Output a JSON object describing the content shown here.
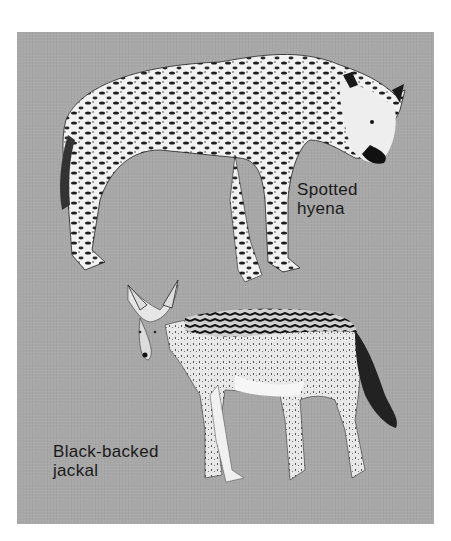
{
  "illustration": {
    "background_color": "#a8a8a8",
    "animals": [
      {
        "name": "hyena",
        "label_lines": [
          "Spotted",
          "hyena"
        ]
      },
      {
        "name": "jackal",
        "label_lines": [
          "Black-backed",
          "jackal"
        ]
      }
    ]
  }
}
